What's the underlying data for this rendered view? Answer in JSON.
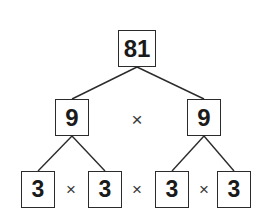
{
  "diagram": {
    "background_color": "#ffffff",
    "border_color": "#2b2b2b",
    "text_color": "#1a1a1a",
    "operator_symbol": "×",
    "levels": [
      {
        "level": 0,
        "nodes": [
          {
            "value": "81",
            "name": "node-81"
          }
        ]
      },
      {
        "level": 1,
        "nodes": [
          {
            "value": "9",
            "name": "node-9-left"
          },
          {
            "value": "9",
            "name": "node-9-right"
          }
        ],
        "operators": [
          "×"
        ]
      },
      {
        "level": 2,
        "nodes": [
          {
            "value": "3",
            "name": "node-3-a"
          },
          {
            "value": "3",
            "name": "node-3-b"
          },
          {
            "value": "3",
            "name": "node-3-c"
          },
          {
            "value": "3",
            "name": "node-3-d"
          }
        ],
        "operators": [
          "×",
          "×",
          "×"
        ]
      }
    ],
    "edges": [
      {
        "from": "node-81",
        "to": "node-9-left",
        "x1": 137,
        "y1": 67,
        "x2": 72,
        "y2": 99
      },
      {
        "from": "node-81",
        "to": "node-9-right",
        "x1": 137,
        "y1": 67,
        "x2": 204,
        "y2": 99
      },
      {
        "from": "node-9-left",
        "to": "node-3-a",
        "x1": 72,
        "y1": 136,
        "x2": 38,
        "y2": 171
      },
      {
        "from": "node-9-left",
        "to": "node-3-b",
        "x1": 72,
        "y1": 136,
        "x2": 105,
        "y2": 171
      },
      {
        "from": "node-9-right",
        "to": "node-3-c",
        "x1": 204,
        "y1": 136,
        "x2": 172,
        "y2": 171
      },
      {
        "from": "node-9-right",
        "to": "node-3-d",
        "x1": 204,
        "y1": 136,
        "x2": 234,
        "y2": 171
      }
    ]
  }
}
